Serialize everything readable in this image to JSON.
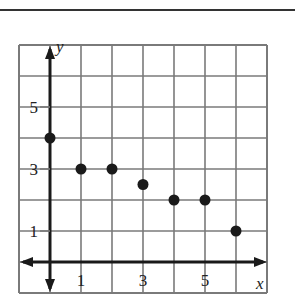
{
  "chart_data": {
    "type": "scatter",
    "title": "",
    "xlabel": "x",
    "ylabel": "y",
    "x": [
      0,
      1,
      2,
      3,
      4,
      5,
      6
    ],
    "y": [
      4,
      3,
      3,
      2.5,
      2,
      2,
      1
    ],
    "xlim": [
      -1,
      7
    ],
    "ylim": [
      -1,
      7
    ],
    "x_tick_labels": [
      "1",
      "3",
      "5"
    ],
    "x_tick_values": [
      1,
      3,
      5
    ],
    "y_tick_labels": [
      "1",
      "3",
      "5"
    ],
    "y_tick_values": [
      1,
      3,
      5
    ],
    "grid": true,
    "grid_step": 1,
    "legend": null,
    "point_color": "#1a1a1a",
    "grid_color": "#7a7a7a",
    "axis_color": "#1a1a1a"
  },
  "labels": {
    "x_axis": "x",
    "y_axis": "y",
    "x_ticks": [
      "1",
      "3",
      "5"
    ],
    "y_ticks": [
      "5",
      "3",
      "1"
    ]
  }
}
